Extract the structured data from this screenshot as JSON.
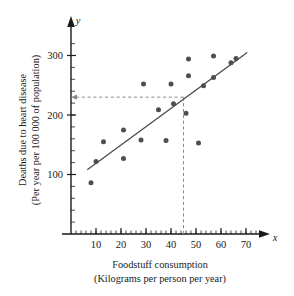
{
  "chart_data": {
    "type": "scatter",
    "title": "",
    "xlabel": "Foodstuff consumption",
    "xlabel_sub": "(Kilograms per person per year)",
    "ylabel": "Deaths due to heart disease",
    "ylabel_sub": "(Per year per 100 000 of population)",
    "x_var": "x",
    "y_var": "y",
    "xlim": [
      0,
      78
    ],
    "ylim": [
      0,
      320
    ],
    "x_ticks": [
      10,
      20,
      30,
      40,
      50,
      60,
      70
    ],
    "y_ticks": [
      100,
      200,
      300
    ],
    "x_minor_step": 2,
    "y_minor_step": 20,
    "grid": false,
    "legend": "none",
    "points": [
      {
        "x": 8,
        "y": 86
      },
      {
        "x": 10,
        "y": 122
      },
      {
        "x": 13,
        "y": 155
      },
      {
        "x": 21,
        "y": 127
      },
      {
        "x": 21,
        "y": 175
      },
      {
        "x": 28,
        "y": 158
      },
      {
        "x": 29,
        "y": 252
      },
      {
        "x": 35,
        "y": 209
      },
      {
        "x": 38,
        "y": 157
      },
      {
        "x": 40,
        "y": 252
      },
      {
        "x": 41,
        "y": 219
      },
      {
        "x": 46,
        "y": 203
      },
      {
        "x": 47,
        "y": 294
      },
      {
        "x": 47,
        "y": 266
      },
      {
        "x": 51,
        "y": 153
      },
      {
        "x": 53,
        "y": 249
      },
      {
        "x": 57,
        "y": 299
      },
      {
        "x": 57,
        "y": 263
      },
      {
        "x": 64,
        "y": 288
      },
      {
        "x": 66,
        "y": 295
      }
    ],
    "fit_line": {
      "label": "line of best fit",
      "x_start": 6.5,
      "y_start": 108,
      "x_end": 70.5,
      "y_end": 305
    },
    "annotations": [
      {
        "name": "prediction-guide",
        "style": "dashed",
        "x_value": 45,
        "y_value": 230,
        "arrow": "left"
      }
    ],
    "colors": {
      "point": "#4d4d52",
      "fit_line": "#4a4a4a",
      "guide_line": "#8c8c8c",
      "axis": "#1a1a1a",
      "background": "#ffffff"
    }
  }
}
